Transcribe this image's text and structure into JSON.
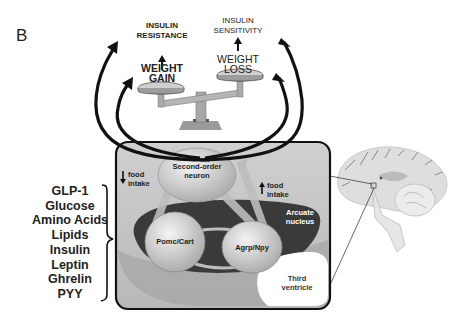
{
  "panel_label": "B",
  "outcomes": {
    "left": {
      "top_label_line1": "INSULIN",
      "top_label_line2": "RESISTANCE",
      "weight_line1": "WEIGHT",
      "weight_line2": "GAIN"
    },
    "right": {
      "top_label_line1": "INSULIN",
      "top_label_line2": "SENSITIVITY",
      "weight_line1": "WEIGHT",
      "weight_line2": "LOSS"
    }
  },
  "signals": [
    "GLP-1",
    "Glucose",
    "Amino Acids",
    "Lipids",
    "Insulin",
    "Leptin",
    "Ghrelin",
    "PYY"
  ],
  "hypothalamus": {
    "second_order_line1": "Second-order",
    "second_order_line2": "neuron",
    "food_intake_down_line1": "food",
    "food_intake_down_line2": "intake",
    "food_intake_up_line1": "food",
    "food_intake_up_line2": "intake",
    "arcuate_line1": "Arcuate",
    "arcuate_line2": "nucleus",
    "pomc": "Pomc/Cart",
    "agrp": "Agrp/Npy",
    "third_ventricle_line1": "Third",
    "third_ventricle_line2": "ventricle"
  },
  "colors": {
    "box_bg": "#c8c8c8",
    "dark_region": "#3a3a3a",
    "neuron_fill": "#dcdcdc",
    "arrow": "#111111",
    "brain": "#d8d8d8"
  }
}
